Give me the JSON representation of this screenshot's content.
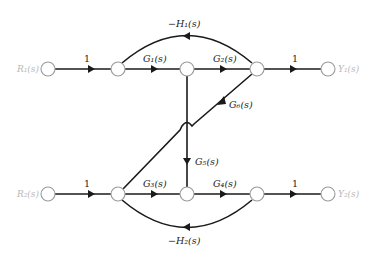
{
  "diagram": {
    "type": "signal-flow-graph",
    "inputs": {
      "r1": "R₁(s)",
      "r2": "R₂(s)"
    },
    "outputs": {
      "y1": "Y₁(s)",
      "y2": "Y₂(s)"
    },
    "branches": {
      "in1": "1",
      "g1": "G₁(s)",
      "g2": "G₂(s)",
      "out1": "1",
      "h1": "−H₁(s)",
      "g6": "G₆(s)",
      "g5": "G₅(s)",
      "in2": "1",
      "g3": "G₃(s)",
      "g4": "G₄(s)",
      "out2": "1",
      "h2": "−H₂(s)"
    },
    "nodes_top": [
      "R1",
      "n1",
      "n2",
      "n3",
      "Y1"
    ],
    "nodes_bottom": [
      "R2",
      "n4",
      "n5",
      "n6",
      "Y2"
    ],
    "colors": {
      "edge": "#1a1a1a",
      "node_stroke": "#9a9a9a",
      "io_label": "#b8b8b8"
    }
  }
}
